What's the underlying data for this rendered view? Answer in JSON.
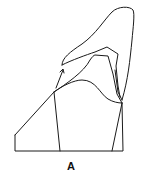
{
  "figure": {
    "label": "A",
    "line_color": "#1a1a1a",
    "background": "#ffffff"
  }
}
